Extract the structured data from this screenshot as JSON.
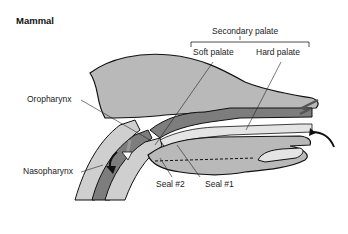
{
  "title": "Mammal",
  "labels": {
    "secondary_palate": "Secondary palate",
    "soft_palate": "Soft palate",
    "hard_palate": "Hard palate",
    "oropharynx": "Oropharynx",
    "nasopharynx": "Nasopharynx",
    "seal_2": "Seal #2",
    "seal_1": "Seal #1"
  },
  "colors": {
    "head_fill": "#b9b9b9",
    "tissue_dark": "#7d7d7d",
    "airway_light": "#e4e4e4",
    "outline": "#111111"
  }
}
